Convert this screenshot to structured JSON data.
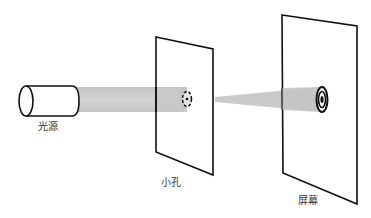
{
  "diagram": {
    "colors": {
      "stroke": "#111111",
      "beam": "#c8c8c8",
      "background": "#ffffff",
      "label": "#333333"
    },
    "labels": {
      "light_source": "光源",
      "pinhole": "小孔",
      "screen": "屏幕"
    },
    "components": [
      {
        "id": "light-source",
        "label": "光源",
        "shape": "cylinder"
      },
      {
        "id": "pinhole-plate",
        "label": "小孔",
        "shape": "plate-with-aperture"
      },
      {
        "id": "screen",
        "label": "屏幕",
        "shape": "plate-with-diffraction-rings"
      }
    ],
    "caption_truncated": true
  }
}
